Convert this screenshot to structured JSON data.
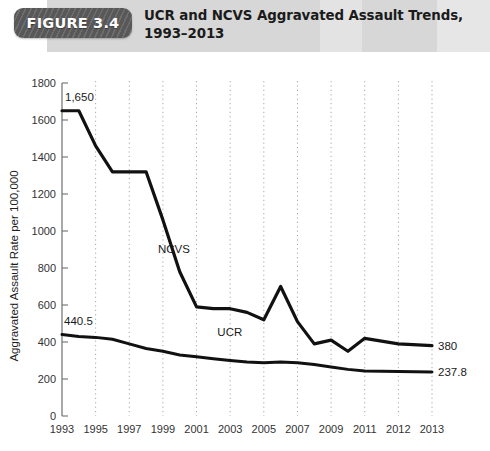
{
  "header": {
    "badge_label": "FIGURE 3.4",
    "title_line1": "UCR and NCVS Aggravated Assault Trends,",
    "title_line2": "1993–2013",
    "band_color": "#d7d7d7",
    "badge_color": "#585858"
  },
  "chart_data": {
    "type": "line",
    "title": "UCR and NCVS Aggravated Assault Trends, 1993–2013",
    "xlabel": "",
    "ylabel": "Aggravated Assault Rate per 100,000",
    "ylim": [
      0,
      1800
    ],
    "xlim": [
      1993,
      2013
    ],
    "grid": true,
    "grid_style": "dotted-vertical",
    "legend": "inline-labels",
    "yticks": [
      0,
      200,
      400,
      600,
      800,
      1000,
      1200,
      1400,
      1600,
      1800
    ],
    "xticks": [
      1993,
      1995,
      1997,
      1999,
      2001,
      2003,
      2005,
      2007,
      2009,
      2011,
      2012,
      2013
    ],
    "x": [
      1993,
      1994,
      1995,
      1996,
      1997,
      1998,
      1999,
      2000,
      2001,
      2002,
      2003,
      2004,
      2005,
      2006,
      2007,
      2008,
      2009,
      2010,
      2011,
      2012,
      2013
    ],
    "series": [
      {
        "name": "NCVS",
        "label": "NCVS",
        "color": "#111111",
        "start_value_label": "1,650",
        "end_value_label": "380",
        "values": [
          1650,
          1650,
          1460,
          1320,
          1320,
          1320,
          1060,
          780,
          590,
          580,
          580,
          560,
          520,
          700,
          510,
          390,
          410,
          350,
          420,
          390,
          380
        ]
      },
      {
        "name": "UCR",
        "label": "UCR",
        "color": "#111111",
        "start_value_label": "440.5",
        "end_value_label": "237.8",
        "values": [
          440.5,
          430,
          425,
          415,
          390,
          365,
          350,
          330,
          320,
          310,
          300,
          292,
          288,
          292,
          288,
          278,
          265,
          252,
          243,
          240,
          237.8
        ]
      }
    ]
  }
}
